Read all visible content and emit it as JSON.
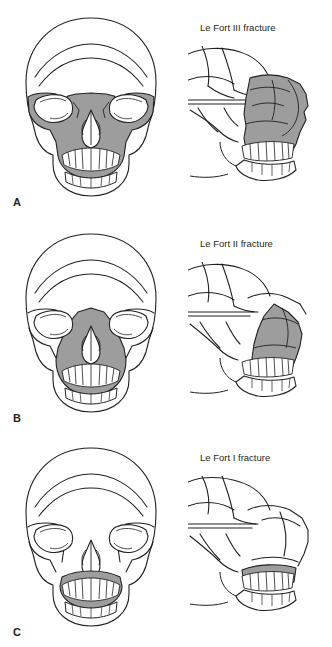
{
  "figure": {
    "title_alt": "Le Fort fracture classification",
    "background": "#ffffff",
    "line_color": "#231f20",
    "shade_color": "#9d9d9d",
    "teeth_color": "#ffffff"
  },
  "panels": [
    {
      "id": "A",
      "label": "A",
      "caption": "Le Fort III fracture",
      "views": [
        {
          "name": "frontal-skull-view",
          "orientation": "frontal"
        },
        {
          "name": "lateral-skull-view",
          "orientation": "lateral"
        }
      ]
    },
    {
      "id": "B",
      "label": "B",
      "caption": "Le Fort II fracture",
      "views": [
        {
          "name": "frontal-skull-view",
          "orientation": "frontal"
        },
        {
          "name": "lateral-skull-view",
          "orientation": "lateral"
        }
      ]
    },
    {
      "id": "C",
      "label": "C",
      "caption": "Le Fort I fracture",
      "views": [
        {
          "name": "frontal-skull-view",
          "orientation": "frontal"
        },
        {
          "name": "lateral-skull-view",
          "orientation": "lateral"
        }
      ]
    }
  ]
}
